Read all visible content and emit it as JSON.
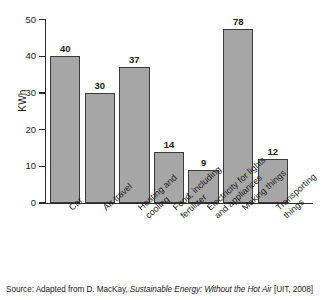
{
  "chart_data": {
    "type": "bar",
    "title": "",
    "xlabel": "",
    "ylabel": "KWh",
    "ylim": [
      0,
      50
    ],
    "yticks": [
      0,
      10,
      20,
      30,
      40,
      50
    ],
    "grid": false,
    "legend": false,
    "categories": [
      "Car",
      "Air travel",
      "Heating and\ncooling",
      "Food, including\nfertilizer",
      "Electricity for lights\nand appliances",
      "Making things",
      "Transporting\nthings"
    ],
    "values": [
      40,
      30,
      37,
      14,
      9,
      78,
      12
    ],
    "drawn_heights": [
      40,
      30,
      37,
      14,
      9,
      47.5,
      12
    ],
    "data_labels": [
      "40",
      "30",
      "37",
      "14",
      "9",
      "78",
      "12"
    ],
    "bar_color": "#a6a6a6",
    "bar_edge_color": "#3a3a3a",
    "axis_color": "#2b2b2b",
    "note": "Bar labelled 78 is drawn to approximately 47.5 on the axis"
  },
  "axis": {
    "y_title": "KWh",
    "y_tick_labels": [
      "50",
      "40",
      "30",
      "20",
      "10",
      "0"
    ]
  },
  "caption": {
    "prefix": "Source: Adapted from D. MacKay, ",
    "italic_title": "Sustainable Energy: Without the Hot Air",
    "suffix": " [UIT, 2008]"
  }
}
